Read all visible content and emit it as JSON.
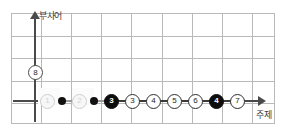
{
  "chart_data": {
    "type": "scatter",
    "title": "",
    "xlabel": "주제",
    "ylabel": "부사어",
    "grid": true,
    "legend": "none",
    "axis_origin_label": "8",
    "note": "Horizontal chain of numbered circle markers along the x-axis (주제), y-axis labelled 부사어 with a circled 8 marker on it.",
    "categories": [
      "1",
      "2",
      "3",
      "3",
      "4",
      "5",
      "6",
      "4",
      "7"
    ],
    "values": [
      0,
      0,
      0,
      0,
      0,
      0,
      0,
      0,
      0
    ],
    "xlim": [
      0,
      9
    ],
    "ylim": [
      0,
      1
    ],
    "markers": [
      {
        "label": "1",
        "style": "ghost",
        "trailing_dot": true
      },
      {
        "label": "2",
        "style": "ghost",
        "trailing_dot": true
      },
      {
        "label": "3",
        "style": "filled",
        "trailing_dot": false
      },
      {
        "label": "3",
        "style": "open",
        "trailing_dot": false
      },
      {
        "label": "4",
        "style": "open",
        "trailing_dot": false
      },
      {
        "label": "5",
        "style": "open",
        "trailing_dot": false
      },
      {
        "label": "6",
        "style": "open",
        "trailing_dot": false
      },
      {
        "label": "4",
        "style": "filled",
        "trailing_dot": false
      },
      {
        "label": "7",
        "style": "open",
        "trailing_dot": false
      }
    ]
  },
  "axes": {
    "y_label": "부사어",
    "x_label": "주제",
    "y_marker_label": "8"
  },
  "colors": {
    "grid_line": "#b9b9b9",
    "axis": "#4a4a4a",
    "marker_fill": "#0d0d0d",
    "marker_open": "#ffffff",
    "marker_ghost": "#f7f7f7",
    "dot": "#111111",
    "background": "#ffffff"
  }
}
